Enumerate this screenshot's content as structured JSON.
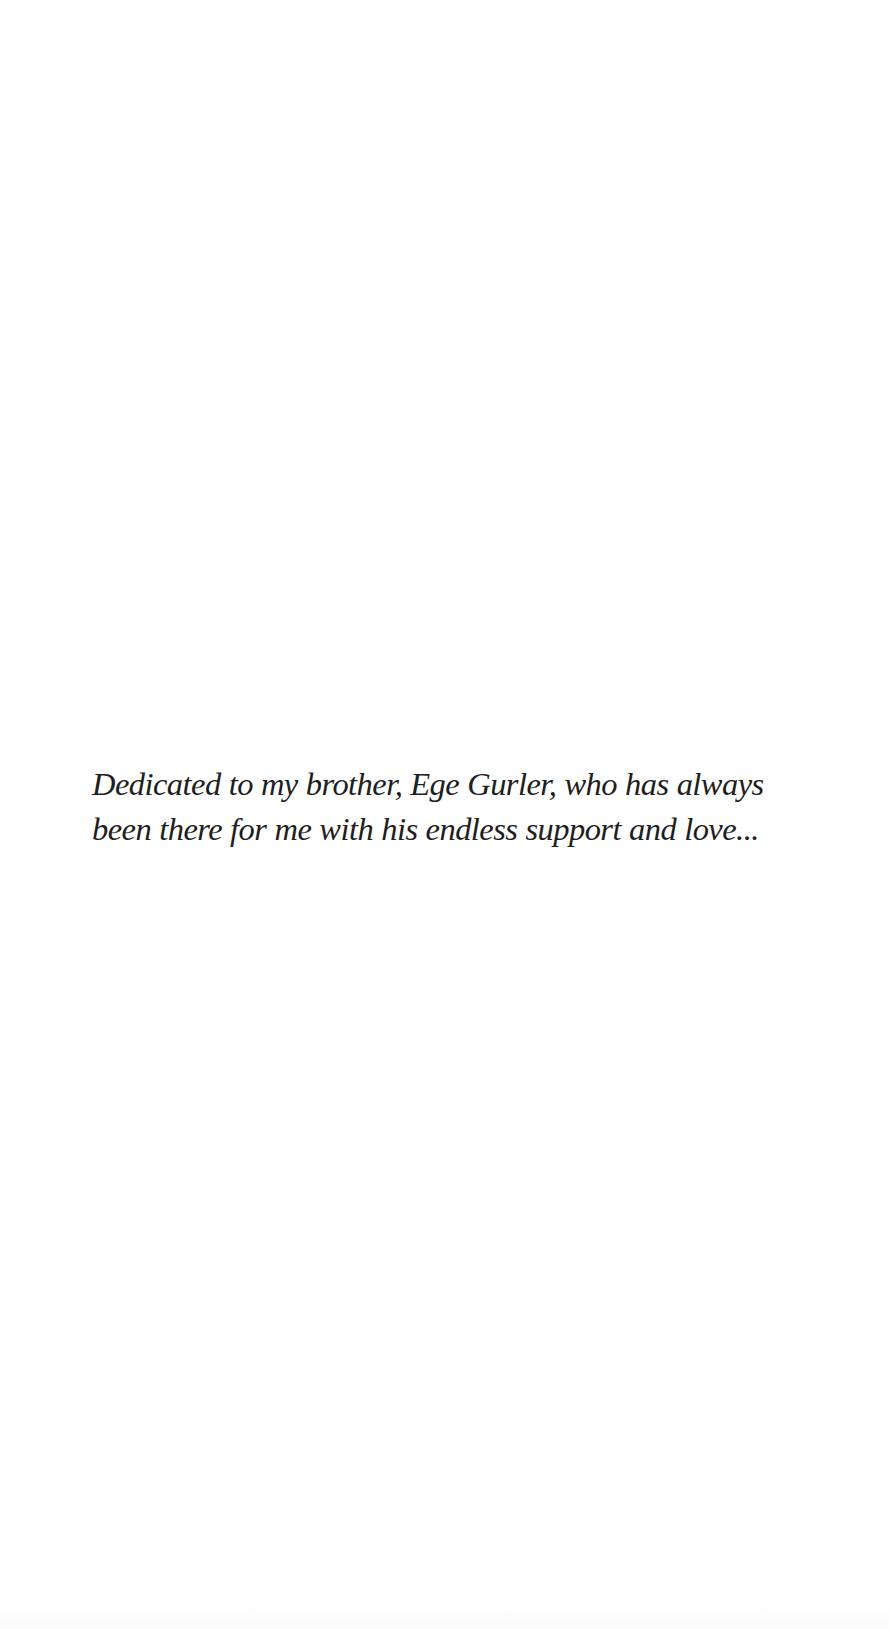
{
  "page": {
    "type": "dedication",
    "background": "#ffffff",
    "text_color": "#1e1e1e"
  },
  "dedication": {
    "lines": [
      "Dedicated to my brother, Ege Gurler, who has always",
      "been there for me with his endless support and love..."
    ]
  }
}
